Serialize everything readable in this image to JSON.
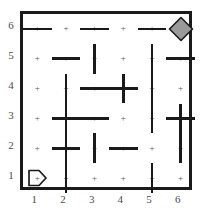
{
  "figure": {
    "kind": "maze-grid",
    "title": "",
    "grid": {
      "cols": 6,
      "rows": 6,
      "cell_px": 28.6
    },
    "colors": {
      "wall": "#1a1a1a",
      "background": "#ffffff",
      "dot": "#555555",
      "label": "#4d4d4d",
      "goal_fill": "#9a9a9a",
      "goal_stroke": "#1a1a1a",
      "start_stroke": "#1a1a1a"
    }
  },
  "axes": {
    "column_labels": [
      "1",
      "2",
      "3",
      "4",
      "5",
      "6"
    ],
    "row_labels": [
      "6",
      "5",
      "4",
      "3",
      "2",
      "1"
    ]
  },
  "cell_dot_glyph": "+",
  "markers": [
    {
      "name": "start-marker",
      "shape": "pentagon-arrow-right",
      "col": 1,
      "row": 1,
      "label": ""
    },
    {
      "name": "goal-marker",
      "shape": "diamond",
      "col": 6,
      "row": 6,
      "label": ""
    }
  ],
  "walls": {
    "horizontal": [
      {
        "col": 1,
        "row_boundary": 5.5,
        "span": 1
      },
      {
        "col": 3,
        "row_boundary": 5.5,
        "span": 1
      },
      {
        "col": 5,
        "row_boundary": 5.5,
        "span": 1
      },
      {
        "col": 2,
        "row_boundary": 4.5,
        "span": 1
      },
      {
        "col": 6,
        "row_boundary": 4.5,
        "span": 1
      },
      {
        "col": 3,
        "row_boundary": 3.5,
        "span": 2
      },
      {
        "col": 2,
        "row_boundary": 2.5,
        "span": 2
      },
      {
        "col": 6,
        "row_boundary": 2.5,
        "span": 1
      },
      {
        "col": 2,
        "row_boundary": 1.5,
        "span": 1
      },
      {
        "col": 4,
        "row_boundary": 1.5,
        "span": 1
      }
    ],
    "vertical": [
      {
        "col_boundary": 1.5,
        "row": 1,
        "span": 2
      },
      {
        "col_boundary": 2.5,
        "row": 5,
        "span": 1
      },
      {
        "col_boundary": 1.5,
        "row": 3,
        "span": 2
      },
      {
        "col_boundary": 3.5,
        "row": 4,
        "span": 1
      },
      {
        "col_boundary": 4.5,
        "row": 5,
        "span": 1
      },
      {
        "col_boundary": 4.5,
        "row": 3,
        "span": 2
      },
      {
        "col_boundary": 5.5,
        "row": 2,
        "span": 2
      },
      {
        "col_boundary": 4.5,
        "row": 1,
        "span": 1
      },
      {
        "col_boundary": 2.5,
        "row": 2,
        "span": 1
      }
    ]
  }
}
